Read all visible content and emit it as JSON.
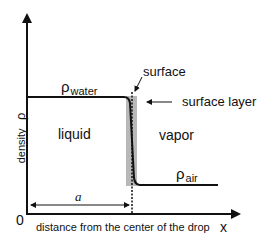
{
  "diagram": {
    "title": "",
    "labels": {
      "rho_water_symbol": "ρ",
      "rho_water_sub": "water",
      "rho_air_symbol": "ρ",
      "rho_air_sub": "air",
      "surface": "surface",
      "surface_layer": "surface layer",
      "liquid": "liquid",
      "vapor": "vapor",
      "y_axis": "density",
      "y_axis_symbol": "ρ",
      "x_axis": "distance from the center of the drop",
      "x_axis_symbol": "x",
      "origin": "0",
      "radius": "a"
    },
    "colors": {
      "line": "#111111",
      "surface_layer_band": "#b8b8b8",
      "background": "#ffffff"
    }
  }
}
